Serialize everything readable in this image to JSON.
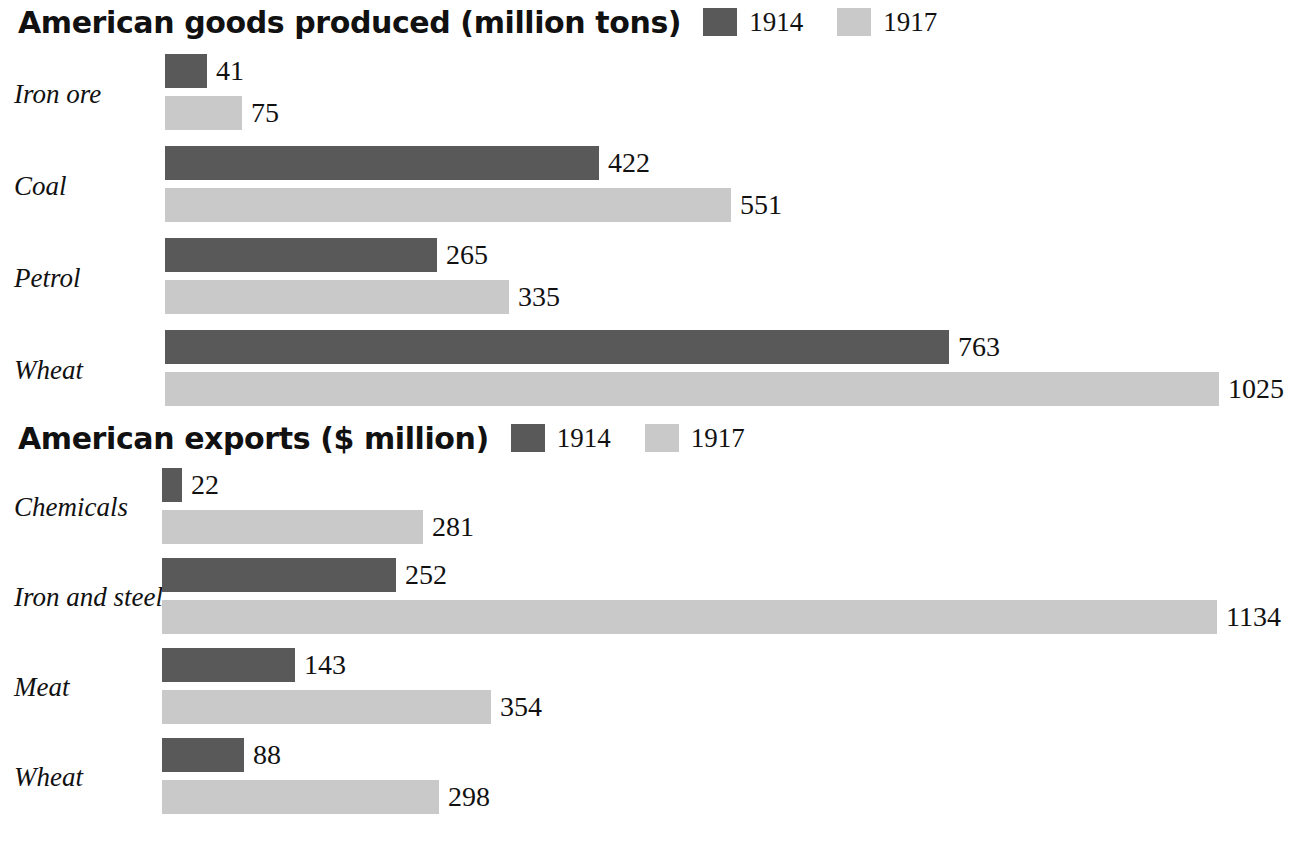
{
  "charts": [
    {
      "id": "chart-1",
      "title": "American goods produced (million tons)",
      "legend": [
        {
          "label": "1914",
          "color": "#595959"
        },
        {
          "label": "1917",
          "color": "#c9c9c9"
        }
      ],
      "categories": [
        "Iron ore",
        "Coal",
        "Petrol",
        "Wheat"
      ],
      "series": [
        {
          "name": "1914",
          "color": "#595959",
          "values": [
            41,
            422,
            265,
            763
          ]
        },
        {
          "name": "1917",
          "color": "#c9c9c9",
          "values": [
            75,
            551,
            335,
            1025
          ]
        }
      ]
    },
    {
      "id": "chart-2",
      "title": "American exports ($ million)",
      "legend": [
        {
          "label": "1914",
          "color": "#595959"
        },
        {
          "label": "1917",
          "color": "#c9c9c9"
        }
      ],
      "categories": [
        "Chemicals",
        "Iron and steel",
        "Meat",
        "Wheat"
      ],
      "series": [
        {
          "name": "1914",
          "color": "#595959",
          "values": [
            22,
            252,
            143,
            88
          ]
        },
        {
          "name": "1917",
          "color": "#c9c9c9",
          "values": [
            281,
            1134,
            354,
            298
          ]
        }
      ]
    }
  ],
  "chart_data": [
    {
      "type": "bar",
      "orientation": "horizontal",
      "title": "American goods produced (million tons)",
      "xlabel": "million tons",
      "ylabel": "",
      "categories": [
        "Iron ore",
        "Coal",
        "Petrol",
        "Wheat"
      ],
      "series": [
        {
          "name": "1914",
          "values": [
            41,
            422,
            265,
            763
          ],
          "color": "#595959"
        },
        {
          "name": "1917",
          "values": [
            75,
            551,
            335,
            1025
          ],
          "color": "#c9c9c9"
        }
      ],
      "legend": [
        "1914",
        "1917"
      ],
      "legend_position": "top-right-of-title",
      "grid": false,
      "xlim": [
        0,
        1025
      ],
      "data_labels": true
    },
    {
      "type": "bar",
      "orientation": "horizontal",
      "title": "American exports ($ million)",
      "xlabel": "$ million",
      "ylabel": "",
      "categories": [
        "Chemicals",
        "Iron and steel",
        "Meat",
        "Wheat"
      ],
      "series": [
        {
          "name": "1914",
          "values": [
            22,
            252,
            143,
            88
          ],
          "color": "#595959"
        },
        {
          "name": "1917",
          "values": [
            281,
            1134,
            354,
            298
          ],
          "color": "#c9c9c9"
        }
      ],
      "legend": [
        "1914",
        "1917"
      ],
      "legend_position": "top-right-of-title",
      "grid": false,
      "xlim": [
        0,
        1134
      ],
      "data_labels": true
    }
  ],
  "render": {
    "chart_1_bar_origin_px": 165,
    "chart_1_px_per_unit": 1.028,
    "chart_2_bar_origin_px": 162,
    "chart_2_px_per_unit": 0.93
  }
}
